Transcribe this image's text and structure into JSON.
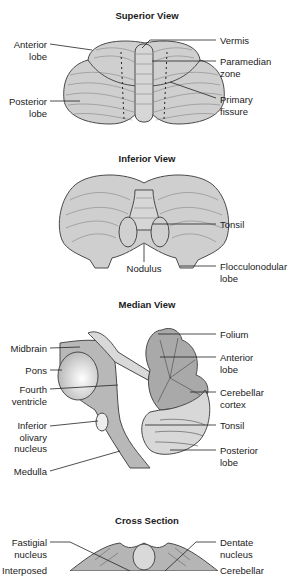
{
  "diagram": {
    "panels": [
      {
        "title": "Superior View",
        "labels_left": [
          "Anterior\nlobe",
          "Posterior\nlobe"
        ],
        "labels_right": [
          "Vermis",
          "Paramedian\nzone",
          "Primary\nfissure"
        ]
      },
      {
        "title": "Inferior View",
        "labels_right": [
          "Tonsil",
          "Flocculonodular\nlobe"
        ],
        "labels_bottom": [
          "Nodulus"
        ]
      },
      {
        "title": "Median View",
        "labels_left": [
          "Midbrain",
          "Pons",
          "Fourth\nventricle",
          "Inferior\nolivary\nnucleus",
          "Medulla"
        ],
        "labels_right": [
          "Folium",
          "Anterior\nlobe",
          "Cerebellar\ncortex",
          "Tonsil",
          "Posterior\nlobe"
        ]
      },
      {
        "title": "Cross Section",
        "labels_left": [
          "Fastigial\nnucleus",
          "Interposed"
        ],
        "labels_right": [
          "Dentate\nnucleus",
          "Cerebellar"
        ]
      }
    ],
    "colors": {
      "tissue_fill": "#c9c9c9",
      "tissue_light": "#dcdcdc",
      "outline": "#4a4a4a",
      "text": "#1a1a1a"
    }
  }
}
